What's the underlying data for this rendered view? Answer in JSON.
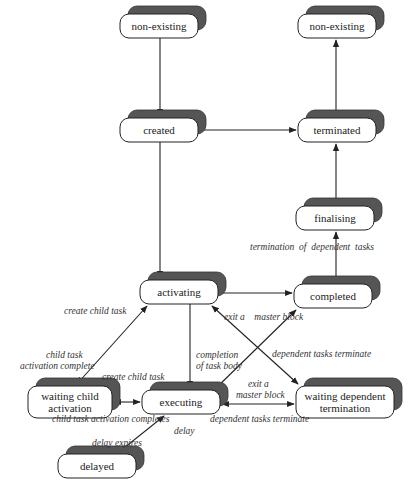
{
  "diagram": {
    "type": "state-transition",
    "states": [
      {
        "id": "non-existing-1",
        "label": "non-existing",
        "x": 120,
        "y": 14,
        "w": 78,
        "h": 24
      },
      {
        "id": "non-existing-2",
        "label": "non-existing",
        "x": 298,
        "y": 14,
        "w": 78,
        "h": 24
      },
      {
        "id": "created",
        "label": "created",
        "x": 120,
        "y": 118,
        "w": 78,
        "h": 24
      },
      {
        "id": "terminated",
        "label": "terminated",
        "x": 298,
        "y": 118,
        "w": 78,
        "h": 24
      },
      {
        "id": "finalising",
        "label": "finalising",
        "x": 296,
        "y": 206,
        "w": 78,
        "h": 24
      },
      {
        "id": "activating",
        "label": "activating",
        "x": 140,
        "y": 280,
        "w": 78,
        "h": 24
      },
      {
        "id": "completed",
        "label": "completed",
        "x": 294,
        "y": 284,
        "w": 78,
        "h": 24
      },
      {
        "id": "waiting-child",
        "label_lines": [
          "waiting child",
          "activation"
        ],
        "x": 28,
        "y": 386,
        "w": 84,
        "h": 32
      },
      {
        "id": "executing",
        "label": "executing",
        "x": 142,
        "y": 390,
        "w": 78,
        "h": 24
      },
      {
        "id": "waiting-dependent",
        "label_lines": [
          "waiting dependent",
          "termination"
        ],
        "x": 296,
        "y": 386,
        "w": 98,
        "h": 32
      },
      {
        "id": "delayed",
        "label": "delayed",
        "x": 58,
        "y": 454,
        "w": 78,
        "h": 24
      }
    ],
    "edge_labels": [
      {
        "id": "lbl-term-dep",
        "text": "termination  of  dependent  tasks",
        "x": 250,
        "y": 250
      },
      {
        "id": "lbl-create-child-1",
        "text": "create child task",
        "x": 64,
        "y": 314
      },
      {
        "id": "lbl-exit-master-1",
        "text": "exit a    master block",
        "x": 224,
        "y": 320
      },
      {
        "id": "lbl-child-act-complete-1",
        "text": "child task",
        "x": 46,
        "y": 358
      },
      {
        "id": "lbl-child-act-complete-2",
        "text": "activation complete",
        "x": 20,
        "y": 369
      },
      {
        "id": "lbl-completion-1",
        "text": "completion",
        "x": 196,
        "y": 358
      },
      {
        "id": "lbl-completion-2",
        "text": "of task body",
        "x": 196,
        "y": 369
      },
      {
        "id": "lbl-dep-terminate-1",
        "text": "dependent tasks terminate",
        "x": 272,
        "y": 357
      },
      {
        "id": "lbl-create-child-2",
        "text": "create child task",
        "x": 102,
        "y": 380
      },
      {
        "id": "lbl-exit-master-2a",
        "text": "exit a",
        "x": 248,
        "y": 387
      },
      {
        "id": "lbl-exit-master-2b",
        "text": "master block",
        "x": 236,
        "y": 398
      },
      {
        "id": "lbl-child-act-completes",
        "text": "child task activation completes",
        "x": 52,
        "y": 422
      },
      {
        "id": "lbl-dep-terminate-2",
        "text": "dependent tasks terminate",
        "x": 210,
        "y": 422
      },
      {
        "id": "lbl-delay",
        "text": "delay",
        "x": 174,
        "y": 434
      },
      {
        "id": "lbl-delay-expires",
        "text": "delay expires",
        "x": 92,
        "y": 446
      }
    ]
  }
}
